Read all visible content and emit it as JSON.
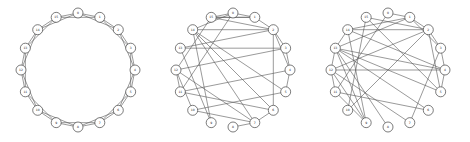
{
  "figure": {
    "node_color": "#ffffff",
    "node_stroke": "#444444",
    "edge_color": "#555555",
    "panels": [
      {
        "id": "ring-lattice",
        "cx": 78,
        "cy": 70,
        "r": 57,
        "node_r": 5,
        "labels": [
          "0",
          "1",
          "2",
          "3",
          "4",
          "5",
          "6",
          "7",
          "8",
          "9",
          "10",
          "11",
          "12",
          "13",
          "14",
          "15"
        ],
        "edges": [
          [
            0,
            1
          ],
          [
            1,
            2
          ],
          [
            2,
            3
          ],
          [
            3,
            4
          ],
          [
            4,
            5
          ],
          [
            5,
            6
          ],
          [
            6,
            7
          ],
          [
            7,
            8
          ],
          [
            8,
            9
          ],
          [
            9,
            10
          ],
          [
            10,
            11
          ],
          [
            11,
            12
          ],
          [
            12,
            13
          ],
          [
            13,
            14
          ],
          [
            14,
            15
          ],
          [
            15,
            0
          ],
          [
            0,
            2
          ],
          [
            1,
            3
          ],
          [
            2,
            4
          ],
          [
            3,
            5
          ],
          [
            4,
            6
          ],
          [
            5,
            7
          ],
          [
            6,
            8
          ],
          [
            7,
            9
          ],
          [
            8,
            10
          ],
          [
            9,
            11
          ],
          [
            10,
            12
          ],
          [
            11,
            13
          ],
          [
            12,
            14
          ],
          [
            13,
            15
          ],
          [
            14,
            0
          ],
          [
            15,
            1
          ]
        ]
      },
      {
        "id": "rewired-low",
        "cx": 233,
        "cy": 70,
        "r": 57,
        "node_r": 5,
        "labels": [
          "0",
          "1",
          "2",
          "3",
          "4",
          "5",
          "6",
          "7",
          "8",
          "9",
          "10",
          "11",
          "12",
          "13",
          "14",
          "15"
        ],
        "edges": [
          [
            0,
            1
          ],
          [
            1,
            2
          ],
          [
            2,
            3
          ],
          [
            3,
            4
          ],
          [
            4,
            5
          ],
          [
            0,
            14
          ],
          [
            15,
            0
          ],
          [
            6,
            7
          ],
          [
            7,
            8
          ],
          [
            15,
            1
          ],
          [
            2,
            13
          ],
          [
            3,
            12
          ],
          [
            13,
            3
          ],
          [
            14,
            7
          ],
          [
            6,
            11
          ],
          [
            7,
            12
          ],
          [
            2,
            14
          ],
          [
            5,
            10
          ],
          [
            11,
            12
          ],
          [
            1,
            15
          ],
          [
            14,
            9
          ],
          [
            15,
            2
          ],
          [
            6,
            2
          ],
          [
            10,
            7
          ],
          [
            2,
            4
          ],
          [
            9,
            13
          ],
          [
            10,
            12
          ],
          [
            11,
            0
          ],
          [
            5,
            14
          ],
          [
            4,
            11
          ],
          [
            14,
            6
          ],
          [
            12,
            15
          ]
        ]
      },
      {
        "id": "rewired-high",
        "cx": 388,
        "cy": 70,
        "r": 57,
        "node_r": 5,
        "labels": [
          "0",
          "1",
          "2",
          "3",
          "4",
          "5",
          "6",
          "7",
          "8",
          "9",
          "10",
          "11",
          "12",
          "13",
          "14",
          "15"
        ],
        "edges": [
          [
            0,
            1
          ],
          [
            1,
            2
          ],
          [
            2,
            3
          ],
          [
            3,
            4
          ],
          [
            4,
            5
          ],
          [
            0,
            11
          ],
          [
            15,
            2
          ],
          [
            13,
            1
          ],
          [
            13,
            4
          ],
          [
            13,
            12
          ],
          [
            6,
            11
          ],
          [
            7,
            12
          ],
          [
            8,
            13
          ],
          [
            14,
            9
          ],
          [
            2,
            14
          ],
          [
            9,
            11
          ],
          [
            11,
            12
          ],
          [
            2,
            5
          ],
          [
            1,
            3
          ],
          [
            15,
            10
          ],
          [
            12,
            2
          ],
          [
            13,
            14
          ],
          [
            15,
            5
          ],
          [
            13,
            9
          ],
          [
            14,
            1
          ],
          [
            4,
            12
          ],
          [
            13,
            5
          ],
          [
            14,
            4
          ],
          [
            10,
            2
          ],
          [
            6,
            13
          ],
          [
            3,
            7
          ],
          [
            9,
            12
          ]
        ]
      }
    ]
  }
}
